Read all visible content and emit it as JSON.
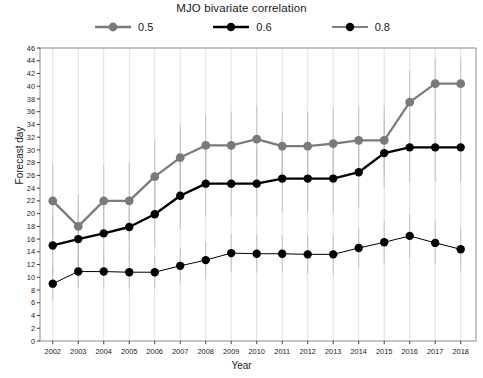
{
  "chart_data": {
    "type": "line",
    "title": "MJO bivariate correlation",
    "xlabel": "Year",
    "ylabel": "Forecast day",
    "grid": "vertical-only",
    "legend_position": "top-center",
    "x": [
      2002,
      2003,
      2004,
      2005,
      2006,
      2007,
      2008,
      2009,
      2010,
      2011,
      2012,
      2013,
      2014,
      2015,
      2016,
      2017,
      2018
    ],
    "categories": [
      "2002",
      "2003",
      "2004",
      "2005",
      "2006",
      "2007",
      "2008",
      "2009",
      "2010",
      "2011",
      "2012",
      "2013",
      "2014",
      "2015",
      "2016",
      "2017",
      "2018"
    ],
    "xlim": [
      2001.5,
      2018.6
    ],
    "ylim": [
      0,
      46
    ],
    "ytick_step": 2,
    "yticks": [
      0,
      2,
      4,
      6,
      8,
      10,
      12,
      14,
      16,
      18,
      20,
      22,
      24,
      26,
      28,
      30,
      32,
      34,
      36,
      38,
      40,
      42,
      44,
      46
    ],
    "series": [
      {
        "name": "0.5",
        "color": "#7a7a7a",
        "line_width": 2.2,
        "marker_size": 4.4,
        "values": [
          22.0,
          18.0,
          22.0,
          22.0,
          25.8,
          28.8,
          30.7,
          30.7,
          31.7,
          30.6,
          30.6,
          31.0,
          31.5,
          31.5,
          37.5,
          40.4,
          40.4
        ],
        "error_low": [
          16.2,
          13.0,
          16.5,
          16.0,
          20.0,
          23.5,
          25.5,
          25.0,
          26.0,
          25.0,
          25.2,
          25.5,
          26.0,
          26.0,
          32.0,
          35.5,
          35.5
        ],
        "error_high": [
          27.8,
          23.0,
          27.5,
          28.0,
          31.5,
          34.0,
          35.5,
          36.0,
          37.0,
          36.0,
          36.0,
          36.5,
          37.0,
          37.0,
          42.5,
          44.5,
          44.5
        ]
      },
      {
        "name": "0.6",
        "color": "#000000",
        "line_width": 2.4,
        "marker_size": 4.2,
        "values": [
          15.0,
          16.0,
          16.9,
          17.9,
          19.9,
          22.8,
          24.7,
          24.7,
          24.7,
          25.5,
          25.5,
          25.5,
          26.5,
          29.5,
          30.4,
          30.4,
          30.4
        ],
        "error_low": [
          10.5,
          11.5,
          12.2,
          13.0,
          14.8,
          17.5,
          19.5,
          19.5,
          19.5,
          20.2,
          20.2,
          20.2,
          21.0,
          24.0,
          25.0,
          25.0,
          25.0
        ],
        "error_high": [
          19.5,
          20.5,
          21.6,
          22.8,
          25.0,
          28.0,
          30.0,
          30.0,
          30.0,
          30.8,
          30.8,
          30.8,
          32.0,
          35.0,
          35.8,
          35.8,
          35.8
        ]
      },
      {
        "name": "0.8",
        "color": "#000000",
        "line_width": 1.0,
        "marker_size": 4.2,
        "values": [
          9.0,
          10.9,
          10.9,
          10.8,
          10.8,
          11.8,
          12.7,
          13.8,
          13.7,
          13.7,
          13.6,
          13.6,
          14.6,
          15.5,
          16.5,
          15.4,
          14.4
        ],
        "error_low": [
          6.5,
          8.3,
          8.3,
          8.2,
          8.2,
          9.0,
          9.8,
          10.8,
          10.7,
          10.7,
          10.6,
          10.6,
          11.4,
          12.2,
          13.0,
          12.0,
          11.0
        ],
        "error_high": [
          11.5,
          13.5,
          13.5,
          13.4,
          13.4,
          14.6,
          15.6,
          16.8,
          16.7,
          16.7,
          16.6,
          16.6,
          17.8,
          18.8,
          20.0,
          18.8,
          17.8
        ]
      }
    ]
  },
  "axis": {
    "ylabel": "Forecast day",
    "xlabel": "Year"
  },
  "title": "MJO bivariate correlation",
  "legend": {
    "items": [
      {
        "label": "0.5"
      },
      {
        "label": "0.6"
      },
      {
        "label": "0.8"
      }
    ]
  }
}
